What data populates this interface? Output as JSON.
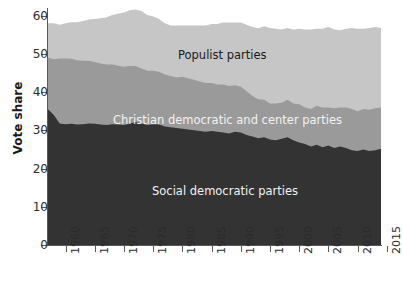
{
  "chart_data": {
    "type": "area",
    "stacked": true,
    "title": "",
    "xlabel": "",
    "ylabel": "Vote share",
    "xlim": [
      1957,
      2014
    ],
    "ylim": [
      0,
      62
    ],
    "yticks": [
      0,
      10,
      20,
      30,
      40,
      50,
      60
    ],
    "xticks": [
      1960,
      1965,
      1970,
      1975,
      1980,
      1985,
      1990,
      1995,
      2000,
      2005,
      2010,
      2015
    ],
    "grid": false,
    "legend_position": "in-plot-labels",
    "colors": {
      "social_democratic": "#333333",
      "christian_democratic": "#9a9a9a",
      "populist": "#c6c6c6",
      "axis": "#5a5a5a",
      "text": "#1a1a1a",
      "label_light": "#f2f2f2",
      "background": "#ffffff"
    },
    "x": [
      1957,
      1958,
      1959,
      1960,
      1961,
      1962,
      1963,
      1964,
      1965,
      1966,
      1967,
      1968,
      1969,
      1970,
      1971,
      1972,
      1973,
      1974,
      1975,
      1976,
      1977,
      1978,
      1979,
      1980,
      1981,
      1982,
      1983,
      1984,
      1985,
      1986,
      1987,
      1988,
      1989,
      1990,
      1991,
      1992,
      1993,
      1994,
      1995,
      1996,
      1997,
      1998,
      1999,
      2000,
      2001,
      2002,
      2003,
      2004,
      2005,
      2006,
      2007,
      2008,
      2009,
      2010,
      2011,
      2012,
      2013,
      2014
    ],
    "series": [
      {
        "name": "Social democratic parties",
        "color": "#333333",
        "label": "Social democratic parties",
        "label_color": "#f2f2f2",
        "values": [
          35.5,
          34.0,
          31.8,
          31.6,
          31.7,
          31.5,
          31.6,
          31.8,
          31.7,
          31.5,
          31.4,
          31.6,
          31.5,
          31.4,
          31.8,
          32.2,
          31.8,
          31.4,
          31.6,
          31.5,
          31.0,
          30.8,
          30.6,
          30.4,
          30.2,
          30.0,
          29.8,
          29.6,
          29.8,
          29.6,
          29.4,
          29.2,
          29.6,
          29.4,
          28.8,
          28.4,
          27.9,
          28.2,
          27.6,
          27.4,
          27.8,
          28.2,
          27.4,
          26.8,
          26.4,
          25.8,
          26.2,
          25.6,
          26.0,
          25.4,
          25.8,
          25.4,
          24.8,
          24.6,
          25.0,
          24.6,
          24.8,
          25.2
        ]
      },
      {
        "name": "Christian democratic and center parties",
        "color": "#9a9a9a",
        "label": "Christian democratic and center parties",
        "label_color": "#f2f2f2",
        "values": [
          13.5,
          14.6,
          17.0,
          17.2,
          17.0,
          16.8,
          16.6,
          16.4,
          16.2,
          16.0,
          15.8,
          15.6,
          15.4,
          15.2,
          15.0,
          14.6,
          14.4,
          14.2,
          14.0,
          13.8,
          13.6,
          13.4,
          13.2,
          13.6,
          13.4,
          13.2,
          13.0,
          12.8,
          12.6,
          12.4,
          12.6,
          12.4,
          12.2,
          12.0,
          11.4,
          10.6,
          10.2,
          9.8,
          9.4,
          9.6,
          9.4,
          9.8,
          9.6,
          10.0,
          9.6,
          9.8,
          10.2,
          10.4,
          10.0,
          10.4,
          10.2,
          10.6,
          10.8,
          10.4,
          10.6,
          10.8,
          11.0,
          10.8
        ]
      },
      {
        "name": "Populist parties",
        "color": "#c6c6c6",
        "label": "Populist parties",
        "label_color": "#1a1a1a",
        "values": [
          9.0,
          9.4,
          8.8,
          9.2,
          9.6,
          10.0,
          10.4,
          10.8,
          11.2,
          11.8,
          12.4,
          13.0,
          13.6,
          14.2,
          14.6,
          14.8,
          15.0,
          14.6,
          14.2,
          13.8,
          13.4,
          13.2,
          13.6,
          13.4,
          13.8,
          14.2,
          14.6,
          15.0,
          15.4,
          15.8,
          16.2,
          16.6,
          16.4,
          16.8,
          17.4,
          18.0,
          18.6,
          19.2,
          19.8,
          19.6,
          19.2,
          18.8,
          19.4,
          19.8,
          20.4,
          20.8,
          20.2,
          20.6,
          21.0,
          20.6,
          20.2,
          20.6,
          21.2,
          21.6,
          21.0,
          21.4,
          21.2,
          20.8
        ]
      }
    ],
    "totals_note": "Top boundary peaks near 61 around 1972-1975 and ends near 57"
  },
  "axis": {
    "y_title": "Vote share",
    "y_tick_labels": [
      "0",
      "10",
      "20",
      "30",
      "40",
      "50",
      "60"
    ],
    "x_tick_labels": [
      "1960",
      "1965",
      "1970",
      "1975",
      "1980",
      "1985",
      "1990",
      "1995",
      "2000",
      "2005",
      "2010",
      "2015"
    ]
  }
}
